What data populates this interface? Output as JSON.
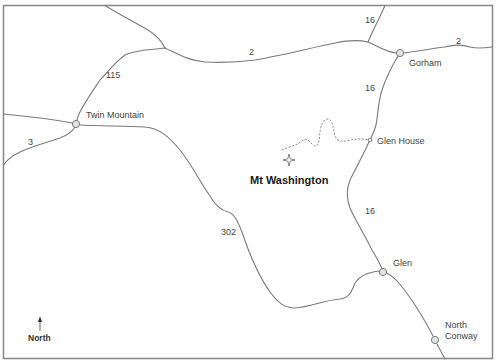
{
  "map": {
    "frame_color": "#8c8c8c",
    "road_color": "#7a7a7a",
    "town_fill": "#e3e3e3",
    "peak": {
      "name": "Mt Washington",
      "icon": "peak-star-icon"
    },
    "towns": [
      {
        "name": "Twin Mountain"
      },
      {
        "name": "Gorham"
      },
      {
        "name": "Glen House"
      },
      {
        "name": "Glen"
      },
      {
        "name": "North",
        "name2": "Conway"
      }
    ],
    "routes": [
      {
        "number": "16",
        "where": "north of Gorham"
      },
      {
        "number": "2",
        "where": "west of Gorham"
      },
      {
        "number": "2",
        "where": "east of Gorham"
      },
      {
        "number": "115",
        "where": "north-east of Twin Mountain"
      },
      {
        "number": "3",
        "where": "south-west of Twin Mountain"
      },
      {
        "number": "16",
        "where": "south of Gorham"
      },
      {
        "number": "302",
        "where": "south-east of Twin Mountain"
      },
      {
        "number": "16",
        "where": "north of Glen"
      }
    ],
    "trail": {
      "description": "Mt Washington Auto Road (dashed)"
    },
    "compass": {
      "label": "North",
      "icon": "north-arrow-icon"
    }
  }
}
